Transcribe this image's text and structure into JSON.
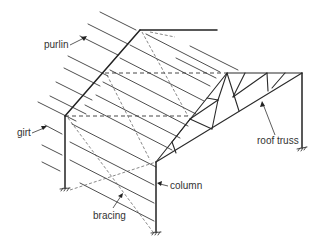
{
  "diagram": {
    "labels": {
      "purlin": "purlin",
      "girt": "girt",
      "bracing": "bracing",
      "column": "column",
      "roof_truss": "roof truss"
    },
    "colors": {
      "line": "#2a2a2a",
      "background": "#ffffff",
      "text": "#333333"
    }
  }
}
